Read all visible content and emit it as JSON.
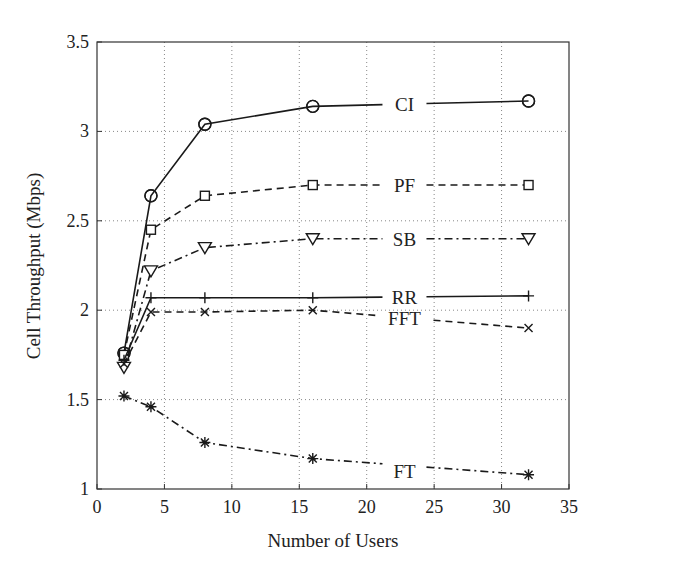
{
  "chart_data": {
    "type": "line",
    "title": "",
    "xlabel": "Number of Users",
    "ylabel": "Cell Throughput (Mbps)",
    "xlim": [
      0,
      35
    ],
    "ylim": [
      1,
      3.5
    ],
    "xticks": [
      0,
      5,
      10,
      15,
      20,
      25,
      30,
      35
    ],
    "yticks": [
      1,
      1.5,
      2,
      2.5,
      3,
      3.5
    ],
    "ytick_labels": [
      "1",
      "1.5",
      "2",
      "2.5",
      "3",
      "3.5"
    ],
    "grid": true,
    "legend_position": "inline labels near right end of each line",
    "x": [
      2,
      4,
      8,
      16,
      32
    ],
    "series": [
      {
        "name": "CI",
        "values": [
          1.76,
          2.64,
          3.04,
          3.14,
          3.17
        ],
        "marker": "circle",
        "linestyle": "solid"
      },
      {
        "name": "PF",
        "values": [
          1.75,
          2.45,
          2.64,
          2.7,
          2.7
        ],
        "marker": "square",
        "linestyle": "dashed"
      },
      {
        "name": "SB",
        "values": [
          1.68,
          2.22,
          2.35,
          2.4,
          2.4
        ],
        "marker": "triangle-down",
        "linestyle": "dashdot"
      },
      {
        "name": "RR",
        "values": [
          1.72,
          2.07,
          2.07,
          2.07,
          2.08
        ],
        "marker": "plus",
        "linestyle": "solid"
      },
      {
        "name": "FFT",
        "values": [
          1.7,
          1.99,
          1.99,
          2.0,
          1.9
        ],
        "marker": "x",
        "linestyle": "dashed"
      },
      {
        "name": "FT",
        "values": [
          1.52,
          1.46,
          1.26,
          1.17,
          1.08
        ],
        "marker": "asterisk",
        "linestyle": "dashdot"
      }
    ],
    "label_positions": {
      "CI": {
        "x": 22.8,
        "y": 3.155
      },
      "PF": {
        "x": 22.8,
        "y": 2.7
      },
      "SB": {
        "x": 22.8,
        "y": 2.4
      },
      "RR": {
        "x": 22.8,
        "y": 2.075
      },
      "FFT": {
        "x": 22.8,
        "y": 1.955
      },
      "FT": {
        "x": 22.8,
        "y": 1.1
      }
    }
  },
  "colors": {
    "line": "#1a1a1a",
    "grid": "#888888",
    "axis": "#333333",
    "background": "#ffffff"
  }
}
